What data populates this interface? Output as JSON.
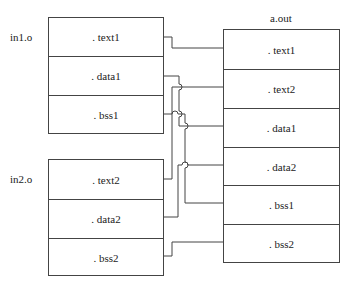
{
  "diagram": {
    "left_objects": [
      {
        "name": "in1.o",
        "sections": [
          ". text1",
          ". data1",
          ". bss1"
        ]
      },
      {
        "name": "in2.o",
        "sections": [
          ". text2",
          ". data2",
          ". bss2"
        ]
      }
    ],
    "output": {
      "name": "a.out",
      "sections": [
        ". text1",
        ". text2",
        ". data1",
        ". data2",
        ". bss1",
        ". bss2"
      ]
    },
    "connections": [
      {
        "from": "in1.o . text1",
        "to": "a.out . text1"
      },
      {
        "from": "in1.o . data1",
        "to": "a.out . data1"
      },
      {
        "from": "in1.o . bss1",
        "to": "a.out . bss1"
      },
      {
        "from": "in2.o . text2",
        "to": "a.out . text2"
      },
      {
        "from": "in2.o . data2",
        "to": "a.out . data2"
      },
      {
        "from": "in2.o . bss2",
        "to": "a.out . bss2"
      }
    ],
    "colors": {
      "line": "#444444",
      "background": "#ffffff"
    }
  }
}
